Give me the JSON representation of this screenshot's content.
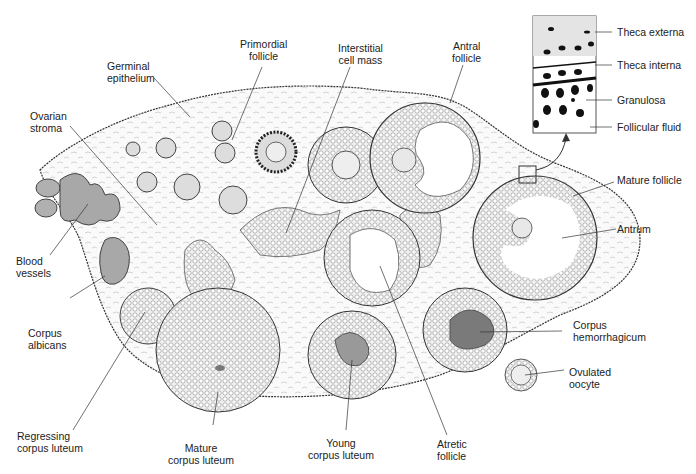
{
  "diagram": {
    "labels": {
      "germinal_epithelium": "Germinal\nepithelium",
      "primordial_follicle": "Primordial\nfollicle",
      "interstitial_cell_mass": "Interstitial\ncell mass",
      "antral_follicle": "Antral\nfollicle",
      "ovarian_stroma": "Ovarian\nstroma",
      "blood_vessels": "Blood\nvessels",
      "corpus_albicans": "Corpus\nalbicans",
      "regressing_corpus_luteum": "Regressing\ncorpus luteum",
      "mature_corpus_luteum": "Mature\ncorpus luteum",
      "young_corpus_luteum": "Young\ncorpus luteum",
      "atretic_follicle": "Atretic\nfollicle",
      "corpus_hemorrhagicum": "Corpus\nhemorrhagicum",
      "ovulated_oocyte": "Ovulated\noocyte",
      "mature_follicle": "Mature follicle",
      "antrum": "Antrum"
    },
    "inset": {
      "labels": {
        "theca_externa": "Theca externa",
        "theca_interna": "Theca interna",
        "granulosa": "Granulosa",
        "follicular_fluid": "Follicular fluid"
      }
    },
    "colors": {
      "line": "#333333",
      "tissue_fill": "#f4f4f4",
      "cell_fill": "#d8d8d8",
      "dark_fill": "#8a8a8a",
      "blood": "#a8a8a8"
    }
  }
}
